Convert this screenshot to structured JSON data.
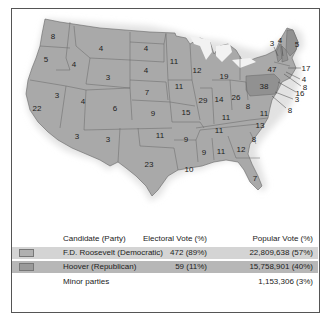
{
  "colors": {
    "fdr_fill": "#a9a9a9",
    "hoover_fill": "#8f8f8f",
    "fdr_row": "#d4d4d4",
    "hoover_row": "#b7b7b7",
    "fdr_swatch": "#b0b0b0",
    "hoover_swatch": "#9a9a9a",
    "border": "#666666"
  },
  "map": {
    "states": [
      {
        "label": "8",
        "x": 53,
        "y": 36
      },
      {
        "label": "5",
        "x": 46,
        "y": 59
      },
      {
        "label": "4",
        "x": 74,
        "y": 64
      },
      {
        "label": "4",
        "x": 101,
        "y": 48
      },
      {
        "label": "4",
        "x": 146,
        "y": 48
      },
      {
        "label": "4",
        "x": 146,
        "y": 70
      },
      {
        "label": "3",
        "x": 108,
        "y": 77
      },
      {
        "label": "3",
        "x": 57,
        "y": 95
      },
      {
        "label": "22",
        "x": 37,
        "y": 108
      },
      {
        "label": "4",
        "x": 83,
        "y": 101
      },
      {
        "label": "6",
        "x": 115,
        "y": 108
      },
      {
        "label": "7",
        "x": 147,
        "y": 92
      },
      {
        "label": "9",
        "x": 153,
        "y": 113
      },
      {
        "label": "11",
        "x": 174,
        "y": 61
      },
      {
        "label": "11",
        "x": 179,
        "y": 86
      },
      {
        "label": "15",
        "x": 186,
        "y": 112
      },
      {
        "label": "12",
        "x": 197,
        "y": 70
      },
      {
        "label": "29",
        "x": 203,
        "y": 100
      },
      {
        "label": "19",
        "x": 224,
        "y": 76
      },
      {
        "label": "14",
        "x": 219,
        "y": 99
      },
      {
        "label": "26",
        "x": 236,
        "y": 97
      },
      {
        "label": "8",
        "x": 248,
        "y": 106
      },
      {
        "label": "38",
        "x": 264,
        "y": 86
      },
      {
        "label": "47",
        "x": 272,
        "y": 69
      },
      {
        "label": "3",
        "x": 272,
        "y": 43
      },
      {
        "label": "4",
        "x": 280,
        "y": 40
      },
      {
        "label": "5",
        "x": 297,
        "y": 44
      },
      {
        "label": "17",
        "x": 306,
        "y": 68
      },
      {
        "label": "4",
        "x": 304,
        "y": 79
      },
      {
        "label": "8",
        "x": 305,
        "y": 87
      },
      {
        "label": "16",
        "x": 300,
        "y": 93
      },
      {
        "label": "3",
        "x": 297,
        "y": 99
      },
      {
        "label": "8",
        "x": 290,
        "y": 110
      },
      {
        "label": "11",
        "x": 264,
        "y": 113
      },
      {
        "label": "13",
        "x": 260,
        "y": 125
      },
      {
        "label": "11",
        "x": 226,
        "y": 117
      },
      {
        "label": "11",
        "x": 219,
        "y": 130
      },
      {
        "label": "8",
        "x": 254,
        "y": 139
      },
      {
        "label": "11",
        "x": 160,
        "y": 135
      },
      {
        "label": "9",
        "x": 186,
        "y": 139
      },
      {
        "label": "9",
        "x": 204,
        "y": 152
      },
      {
        "label": "11",
        "x": 221,
        "y": 151
      },
      {
        "label": "12",
        "x": 241,
        "y": 149
      },
      {
        "label": "10",
        "x": 189,
        "y": 169
      },
      {
        "label": "3",
        "x": 77,
        "y": 136
      },
      {
        "label": "3",
        "x": 108,
        "y": 139
      },
      {
        "label": "23",
        "x": 149,
        "y": 164
      },
      {
        "label": "7",
        "x": 255,
        "y": 178
      }
    ]
  },
  "legend": {
    "header": {
      "candidate": "Candidate (Party)",
      "electoral": "Electoral Vote (%)",
      "popular": "Popular Vote (%)"
    },
    "rows": [
      {
        "candidate": "F.D. Roosevelt (Democratic)",
        "electoral": "472 (89%)",
        "popular": "22,809,638 (57%)"
      },
      {
        "candidate": "Hoover (Republican)",
        "electoral": "59 (11%)",
        "popular": "15,758,901 (40%)"
      },
      {
        "candidate": "Minor parties",
        "electoral": "",
        "popular": "1,153,306 (3%)"
      }
    ]
  }
}
